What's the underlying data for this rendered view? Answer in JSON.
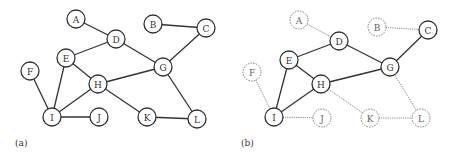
{
  "panels": [
    {
      "id": "a",
      "label": "(a)",
      "offset_x": 0,
      "label_pos": [
        15,
        146
      ],
      "nodes": [
        {
          "id": "A",
          "x": 76,
          "y": 19,
          "style": "solid"
        },
        {
          "id": "B",
          "x": 153,
          "y": 24,
          "style": "solid"
        },
        {
          "id": "C",
          "x": 206,
          "y": 28,
          "style": "solid"
        },
        {
          "id": "D",
          "x": 116,
          "y": 39,
          "style": "solid"
        },
        {
          "id": "E",
          "x": 66,
          "y": 58,
          "style": "solid"
        },
        {
          "id": "F",
          "x": 30,
          "y": 71,
          "style": "solid"
        },
        {
          "id": "G",
          "x": 163,
          "y": 67,
          "style": "solid"
        },
        {
          "id": "H",
          "x": 98,
          "y": 84,
          "style": "solid"
        },
        {
          "id": "I",
          "x": 52,
          "y": 117,
          "style": "solid"
        },
        {
          "id": "J",
          "x": 99,
          "y": 117,
          "style": "solid"
        },
        {
          "id": "K",
          "x": 147,
          "y": 117,
          "style": "solid"
        },
        {
          "id": "L",
          "x": 197,
          "y": 119,
          "style": "solid"
        }
      ],
      "edges": [
        {
          "from": "A",
          "to": "D",
          "style": "solid"
        },
        {
          "from": "B",
          "to": "C",
          "style": "solid"
        },
        {
          "from": "D",
          "to": "E",
          "style": "solid"
        },
        {
          "from": "D",
          "to": "G",
          "style": "solid"
        },
        {
          "from": "C",
          "to": "G",
          "style": "solid"
        },
        {
          "from": "E",
          "to": "H",
          "style": "solid"
        },
        {
          "from": "E",
          "to": "I",
          "style": "solid"
        },
        {
          "from": "F",
          "to": "I",
          "style": "solid"
        },
        {
          "from": "H",
          "to": "I",
          "style": "solid"
        },
        {
          "from": "H",
          "to": "G",
          "style": "solid"
        },
        {
          "from": "H",
          "to": "K",
          "style": "solid"
        },
        {
          "from": "G",
          "to": "L",
          "style": "solid"
        },
        {
          "from": "I",
          "to": "J",
          "style": "solid"
        },
        {
          "from": "K",
          "to": "L",
          "style": "solid"
        }
      ]
    },
    {
      "id": "b",
      "label": "(b)",
      "offset_x": 0,
      "label_pos": [
        241,
        146
      ],
      "nodes": [
        {
          "id": "A",
          "x": 299,
          "y": 20,
          "style": "dashed"
        },
        {
          "id": "B",
          "x": 377,
          "y": 27,
          "style": "dashed"
        },
        {
          "id": "C",
          "x": 428,
          "y": 30,
          "style": "solid"
        },
        {
          "id": "D",
          "x": 339,
          "y": 41,
          "style": "solid"
        },
        {
          "id": "E",
          "x": 289,
          "y": 60,
          "style": "solid"
        },
        {
          "id": "F",
          "x": 252,
          "y": 72,
          "style": "dashed"
        },
        {
          "id": "G",
          "x": 390,
          "y": 67,
          "style": "solid"
        },
        {
          "id": "H",
          "x": 321,
          "y": 84,
          "style": "solid"
        },
        {
          "id": "I",
          "x": 274,
          "y": 117,
          "style": "solid"
        },
        {
          "id": "J",
          "x": 322,
          "y": 118,
          "style": "dashed"
        },
        {
          "id": "K",
          "x": 370,
          "y": 118,
          "style": "dashed"
        },
        {
          "id": "L",
          "x": 421,
          "y": 118,
          "style": "dashed"
        }
      ],
      "edges": [
        {
          "from": "A",
          "to": "D",
          "style": "dotted"
        },
        {
          "from": "B",
          "to": "C",
          "style": "dotted"
        },
        {
          "from": "D",
          "to": "E",
          "style": "solid"
        },
        {
          "from": "D",
          "to": "G",
          "style": "solid"
        },
        {
          "from": "C",
          "to": "G",
          "style": "solid"
        },
        {
          "from": "E",
          "to": "H",
          "style": "solid"
        },
        {
          "from": "E",
          "to": "I",
          "style": "solid"
        },
        {
          "from": "F",
          "to": "I",
          "style": "dotted"
        },
        {
          "from": "H",
          "to": "I",
          "style": "solid"
        },
        {
          "from": "H",
          "to": "G",
          "style": "solid"
        },
        {
          "from": "H",
          "to": "K",
          "style": "dotted"
        },
        {
          "from": "G",
          "to": "L",
          "style": "dotted"
        },
        {
          "from": "I",
          "to": "J",
          "style": "dotted"
        },
        {
          "from": "K",
          "to": "L",
          "style": "dotted"
        }
      ]
    }
  ],
  "node_radius": 9
}
